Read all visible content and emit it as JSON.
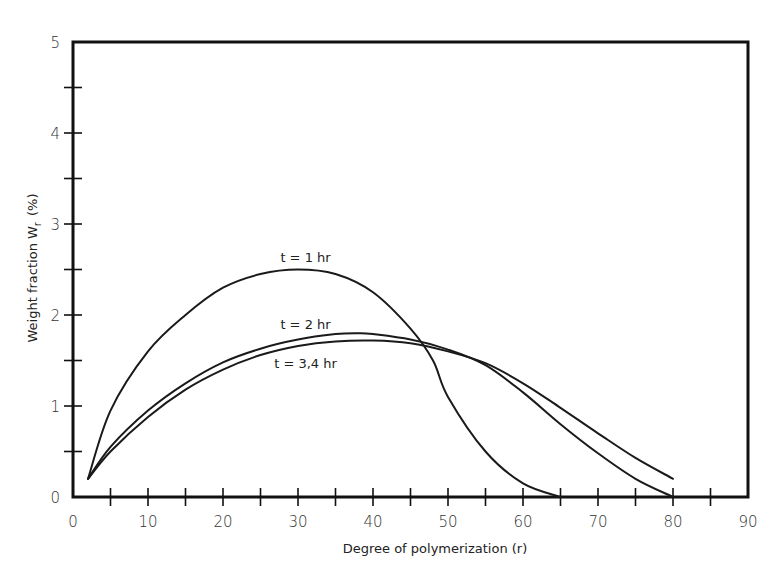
{
  "chart_data": {
    "type": "line",
    "title": "",
    "xlabel": "Degree of polymerization (r)",
    "ylabel": "Weight fraction W",
    "ylabel_subscript": "r",
    "ylabel_unit": "(%)",
    "xlim": [
      0,
      90
    ],
    "ylim": [
      0,
      5
    ],
    "x_ticks_major": [
      0,
      10,
      20,
      30,
      40,
      50,
      60,
      70,
      80,
      90
    ],
    "x_tick_labels": [
      "0",
      "10",
      "20",
      "30",
      "40",
      "50",
      "60",
      "70",
      "80",
      "90"
    ],
    "x_ticks_minor": [
      5,
      15,
      25,
      35,
      45,
      55,
      65,
      75,
      85
    ],
    "y_ticks_major": [
      0,
      1,
      2,
      3,
      4,
      5
    ],
    "y_tick_labels": [
      "0",
      "1",
      "2",
      "3",
      "4",
      "5"
    ],
    "y_ticks_minor": [
      0.5,
      1.5,
      2.5,
      3.5,
      4.5
    ],
    "grid": false,
    "legend": "none (inline annotations)",
    "series": [
      {
        "name": "t = 1 hr",
        "label": "t = 1 hr",
        "x": [
          2,
          5,
          10,
          15,
          20,
          25,
          30,
          35,
          40,
          45,
          48,
          50,
          55,
          60,
          65
        ],
        "y": [
          0.2,
          0.95,
          1.6,
          2.0,
          2.3,
          2.45,
          2.5,
          2.45,
          2.25,
          1.85,
          1.5,
          1.1,
          0.5,
          0.15,
          0.0
        ]
      },
      {
        "name": "t = 2 hr",
        "label": "t = 2 hr",
        "x": [
          2,
          5,
          10,
          15,
          20,
          25,
          30,
          35,
          38,
          40,
          45,
          50,
          55,
          60,
          65,
          70,
          75,
          80
        ],
        "y": [
          0.2,
          0.55,
          0.95,
          1.25,
          1.48,
          1.63,
          1.73,
          1.79,
          1.8,
          1.79,
          1.73,
          1.62,
          1.45,
          1.15,
          0.8,
          0.48,
          0.2,
          0.0
        ]
      },
      {
        "name": "t = 3,4 hr",
        "label": "t = 3,4 hr",
        "x": [
          2,
          5,
          10,
          15,
          20,
          25,
          30,
          35,
          40,
          45,
          50,
          55,
          60,
          65,
          70,
          75,
          80
        ],
        "y": [
          0.2,
          0.5,
          0.88,
          1.18,
          1.4,
          1.56,
          1.66,
          1.71,
          1.72,
          1.69,
          1.6,
          1.47,
          1.25,
          0.98,
          0.7,
          0.43,
          0.2
        ]
      }
    ],
    "annotations": [
      {
        "text": "t = 1 hr",
        "x": 31,
        "y": 2.58,
        "series": "t = 1 hr"
      },
      {
        "text": "t = 2 hr",
        "x": 31,
        "y": 1.85,
        "series": "t = 2 hr"
      },
      {
        "text": "t = 3,4 hr",
        "x": 31,
        "y": 1.42,
        "series": "t = 3,4 hr"
      }
    ]
  }
}
